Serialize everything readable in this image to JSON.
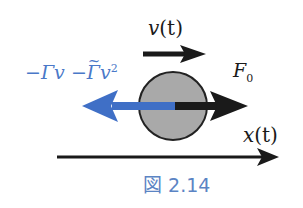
{
  "figure": {
    "caption": "図 2.14",
    "labels": {
      "velocity": {
        "symbol": "v",
        "arg": "(t)"
      },
      "position": {
        "symbol": "x",
        "arg": "(t)"
      },
      "force": {
        "symbol": "F",
        "subscript": "0"
      },
      "drag": {
        "term1_sign": "−",
        "term1_coef": "Γ",
        "term1_var": "v",
        "term2_sign": "−",
        "term2_coef": "Γ",
        "term2_tilde": "~",
        "term2_var": "v",
        "term2_power": "2"
      }
    },
    "colors": {
      "ink": "#1a1a1a",
      "drag_arrow": "#3f6fc6",
      "drag_text": "#4a78c8",
      "ball_fill": "#a9a9a9",
      "ball_stroke": "#222222",
      "caption": "#5b84c4"
    }
  }
}
